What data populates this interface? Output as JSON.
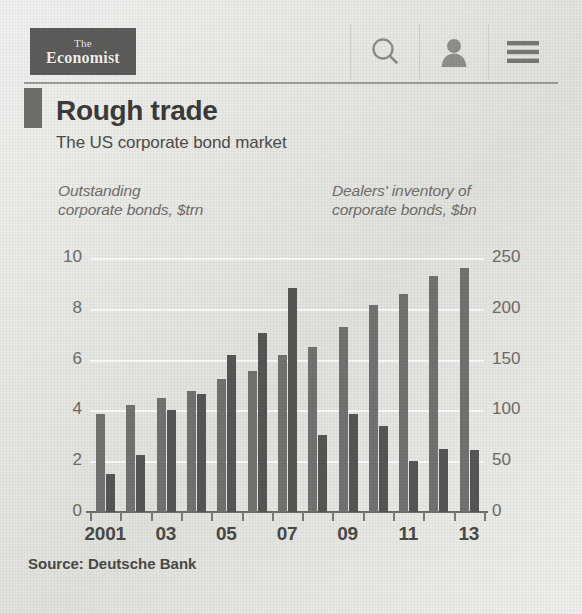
{
  "header": {
    "logo_line1": "The",
    "logo_line2": "Economist",
    "icons": [
      {
        "name": "search-icon",
        "label": "Search"
      },
      {
        "name": "user-icon",
        "label": "Account"
      },
      {
        "name": "hamburger-menu-icon",
        "label": "Menu"
      }
    ]
  },
  "article": {
    "title": "Rough trade",
    "subtitle": "The US corporate bond market",
    "source": "Source: Deutsche Bank"
  },
  "chart_data": {
    "type": "bar",
    "title": "Rough trade",
    "subtitle": "The US corporate bond market",
    "xlabel": "",
    "categories": [
      "2001",
      "2002",
      "2003",
      "2004",
      "2005",
      "2006",
      "2007",
      "2008",
      "2009",
      "2010",
      "2011",
      "2012",
      "2013"
    ],
    "xtick_labels": [
      "2001",
      "",
      "03",
      "",
      "05",
      "",
      "07",
      "",
      "09",
      "",
      "11",
      "",
      "13"
    ],
    "grid": true,
    "legend": "none",
    "series": [
      {
        "name": "Outstanding corporate bonds, $trn",
        "axis": "left",
        "unit": "$trn",
        "color": "#727270",
        "values": [
          3.85,
          4.2,
          4.5,
          4.75,
          5.25,
          5.55,
          6.2,
          6.5,
          7.3,
          8.15,
          8.6,
          9.3,
          9.6
        ]
      },
      {
        "name": "Dealers' inventory of corporate bonds, $bn",
        "axis": "right",
        "unit": "$bn",
        "color": "#565654",
        "values": [
          37,
          56,
          100,
          116,
          155,
          176,
          220,
          76,
          96,
          85,
          50,
          62,
          61
        ]
      }
    ],
    "left_axis": {
      "label_line1": "Outstanding",
      "label_line2": "corporate bonds, $trn",
      "ticks": [
        "0",
        "2",
        "4",
        "6",
        "8",
        "10"
      ],
      "ylim": [
        0,
        10
      ]
    },
    "right_axis": {
      "label_line1": "Dealers' inventory of",
      "label_line2": "corporate bonds, $bn",
      "ticks": [
        "0",
        "50",
        "100",
        "150",
        "200",
        "250"
      ],
      "ylim": [
        0,
        250
      ]
    }
  }
}
